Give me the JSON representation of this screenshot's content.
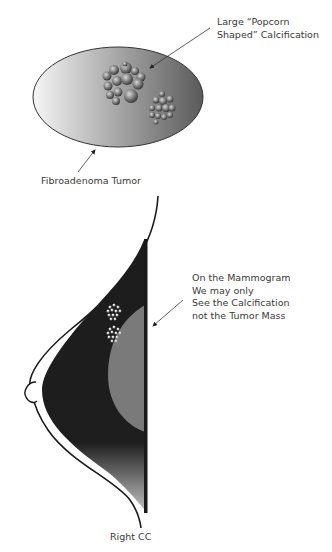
{
  "diagram": {
    "top_figure": {
      "name": "Fibroadenoma with popcorn calcification",
      "labels": {
        "calcification_line1": "Large “Popcorn",
        "calcification_line2": "Shaped” Calcification",
        "tumor": "Fibroadenoma Tumor"
      }
    },
    "bottom_figure": {
      "name": "Mammogram view",
      "labels": {
        "note_line1": "On the Mammogram",
        "note_line2": "We may only",
        "note_line3": "See the Calcification",
        "note_line4": "not the Tumor Mass",
        "view": "Right CC"
      }
    },
    "colors": {
      "tumor_light": "#f4f4f4",
      "tumor_dark": "#555555",
      "breast_tissue": "#1c1c1c",
      "tumor_mass_on_mammogram": "#7a7a7a",
      "outline": "#222222",
      "text": "#3a3a3a"
    }
  }
}
